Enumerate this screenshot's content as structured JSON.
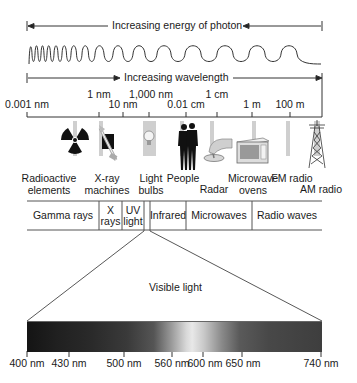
{
  "diagram": {
    "title_arrows": {
      "energy_label": "Increasing energy of photon",
      "wavelength_label": "Increasing wavelength"
    },
    "wavelength_scale": {
      "ticks": [
        {
          "label": "0.001 nm",
          "x": 27,
          "row": "lower"
        },
        {
          "label": "1 nm",
          "x": 99,
          "row": "upper"
        },
        {
          "label": "10 nm",
          "x": 123,
          "row": "lower"
        },
        {
          "label": "1,000 nm",
          "x": 149,
          "row": "upper"
        },
        {
          "label": "0.01 cm",
          "x": 186,
          "row": "lower"
        },
        {
          "label": "1 cm",
          "x": 217,
          "row": "upper"
        },
        {
          "label": "1 m",
          "x": 252,
          "row": "lower"
        },
        {
          "label": "100 m",
          "x": 290,
          "row": "lower"
        }
      ]
    },
    "sources": [
      {
        "label_line1": "Radioactive",
        "label_line2": "elements",
        "icon": "radiation-icon"
      },
      {
        "label_line1": "X-ray",
        "label_line2": "machines",
        "icon": "xray-machine-icon"
      },
      {
        "label_line1": "Light",
        "label_line2": "bulbs",
        "icon": "light-bulb-icon"
      },
      {
        "label_line1": "People",
        "label_line2": "",
        "icon": "people-icon"
      },
      {
        "label_line1": "Radar",
        "label_line2": "",
        "icon": "radar-icon"
      },
      {
        "label_line1": "Microwave",
        "label_line2": "ovens",
        "icon": "microwave-oven-icon"
      },
      {
        "label_line1": "FM radio",
        "label_line2": "",
        "icon": "fm-radio-icon"
      },
      {
        "label_line1": "AM radio",
        "label_line2": "",
        "icon": "radio-tower-icon"
      }
    ],
    "bands": [
      {
        "label": "Gamma rays"
      },
      {
        "label_line1": "X",
        "label_line2": "rays"
      },
      {
        "label_line1": "UV",
        "label_line2": "light"
      },
      {
        "label": "Infrared"
      },
      {
        "label": "Microwaves"
      },
      {
        "label": "Radio waves"
      }
    ],
    "visible_light": {
      "title": "Visible light",
      "ticks": [
        "400 nm",
        "430 nm",
        "500 nm",
        "560 nm",
        "600 nm",
        "650 nm",
        "740 nm"
      ]
    }
  }
}
